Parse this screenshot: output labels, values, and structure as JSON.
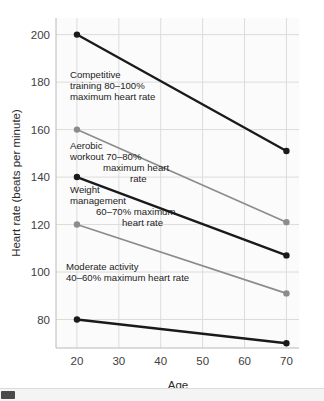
{
  "chart_data": {
    "type": "line",
    "title": "",
    "xlabel": "Age",
    "ylabel": "Heart rate (beats per minute)",
    "x": [
      20,
      70
    ],
    "xlim": [
      15,
      73
    ],
    "ylim": [
      68,
      207
    ],
    "xticks": [
      20,
      30,
      40,
      50,
      60,
      70
    ],
    "yticks": [
      80,
      100,
      120,
      140,
      160,
      180,
      200
    ],
    "grid": true,
    "legend_position": "none",
    "series": [
      {
        "name": "100% maximum heart rate",
        "values": [
          200,
          151
        ],
        "color": "#1a1a1a",
        "width": 2.3
      },
      {
        "name": "80% maximum heart rate",
        "values": [
          160,
          121
        ],
        "color": "#8c8c8c",
        "width": 1.7
      },
      {
        "name": "70% maximum heart rate",
        "values": [
          140,
          107
        ],
        "color": "#1a1a1a",
        "width": 2.3
      },
      {
        "name": "60% maximum heart rate",
        "values": [
          120,
          91
        ],
        "color": "#8c8c8c",
        "width": 1.7
      },
      {
        "name": "40% maximum heart rate",
        "values": [
          80,
          70
        ],
        "color": "#1a1a1a",
        "width": 2.3
      }
    ],
    "annotations": [
      {
        "name": "competitive-zone-label",
        "lines": [
          {
            "text": "Competitive",
            "x": 70,
            "y": 78
          },
          {
            "text": "training 80–100%",
            "x": 70,
            "y": 89
          },
          {
            "text": "maximum heart rate",
            "x": 70,
            "y": 100
          }
        ]
      },
      {
        "name": "aerobic-zone-label",
        "lines": [
          {
            "text": "Aerobic",
            "x": 70,
            "y": 149
          },
          {
            "text": "workout 70–80%",
            "x": 70,
            "y": 160
          },
          {
            "text": "maximum heart",
            "x": 103,
            "y": 171
          },
          {
            "text": "rate",
            "x": 130,
            "y": 182
          }
        ]
      },
      {
        "name": "weight-management-zone-label",
        "lines": [
          {
            "text": "Weight",
            "x": 70,
            "y": 193
          },
          {
            "text": "management",
            "x": 70,
            "y": 204
          },
          {
            "text": "60–70% maximum",
            "x": 96,
            "y": 215
          },
          {
            "text": "heart rate",
            "x": 122,
            "y": 226
          }
        ]
      },
      {
        "name": "moderate-activity-zone-label",
        "lines": [
          {
            "text": "Moderate activity",
            "x": 66,
            "y": 270
          },
          {
            "text": "40–60% maximum heart rate",
            "x": 66,
            "y": 281
          }
        ]
      }
    ]
  },
  "scrollbar": {
    "name": "horizontal-scrollbar",
    "thumb_label": ""
  }
}
